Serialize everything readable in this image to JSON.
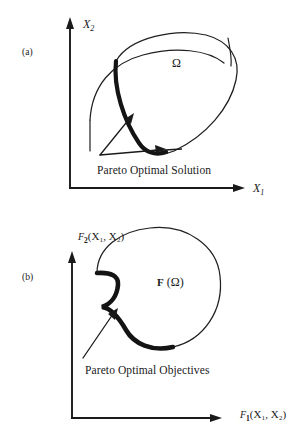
{
  "figure": {
    "background_color": "#ffffff",
    "ink_color": "#1a1a1a",
    "panels": [
      {
        "id": "a",
        "panel_label": "(a)",
        "y_axis_label_base": "X",
        "y_axis_label_sub": "2",
        "x_axis_label_base": "X",
        "x_axis_label_sub": "1",
        "region_label": "Ω",
        "annotation": "Pareto Optimal Solution",
        "description": "Decision variable space with feasible region Omega and a bold Pareto optimal solution arc on its lower-left boundary, crossed by a constraint curve."
      },
      {
        "id": "b",
        "panel_label": "(b)",
        "y_axis_label_f": "F",
        "y_axis_label_f_sub": "2",
        "y_axis_label_args": "(X₁, X₂)",
        "x_axis_label_f": "F",
        "x_axis_label_f_sub": "1",
        "x_axis_label_args": "(X₁, X₂)",
        "region_label_f": "F",
        "region_label_rest": "(Ω)",
        "annotation": "Pareto Optimal Objectives",
        "description": "Objective space with image F(Omega) of the feasible region and a bold Pareto optimal objectives arc on its lower-left boundary."
      }
    ],
    "cut_caption": "Figure caption partially cut off at bottom edge"
  }
}
